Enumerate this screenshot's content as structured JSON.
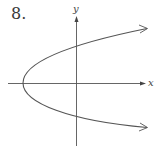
{
  "problem_number": "8.",
  "axes": {
    "x_label": "x",
    "y_label": "y"
  },
  "curve": {
    "type": "parabola",
    "opens": "right",
    "description": "Sideways parabola with vertex left of the origin on the x-axis, both branches extending right with arrowheads"
  },
  "colors": {
    "curve": "#555555",
    "axes": "#555555",
    "text": "#3a3a3a"
  }
}
